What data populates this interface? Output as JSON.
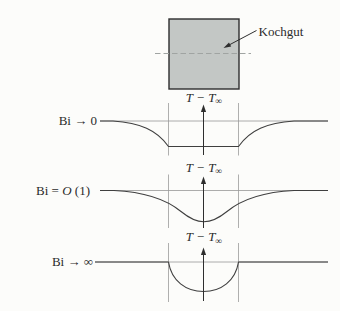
{
  "colors": {
    "background": "#fcfcfa",
    "square_fill": "#c3c7c5",
    "square_border": "#2e2e2e",
    "curve_line": "#3f3f3f",
    "axis_line": "#979797",
    "guide_line": "#9a9a9a",
    "dashed_centerline": "#a0a4a2",
    "text": "#2b2b2b"
  },
  "kochgut": {
    "label": "Kochgut"
  },
  "axis_label": {
    "main": "T − T",
    "sub": "∞"
  },
  "profiles": [
    {
      "label": "Bi → 0"
    },
    {
      "label_pre": "Bi = ",
      "label_var": "O",
      "label_post": " (1)"
    },
    {
      "label": "Bi → ∞"
    }
  ]
}
